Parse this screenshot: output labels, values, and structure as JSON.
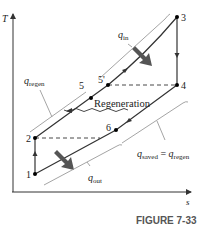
{
  "diagram": {
    "type": "T-s diagram (Brayton cycle with regeneration)",
    "axes": {
      "y_label": "T",
      "x_label": "s"
    },
    "points": [
      {
        "id": "1",
        "label": "1"
      },
      {
        "id": "2",
        "label": "2"
      },
      {
        "id": "3",
        "label": "3"
      },
      {
        "id": "4",
        "label": "4"
      },
      {
        "id": "5",
        "label": "5"
      },
      {
        "id": "5p",
        "label": "5'"
      },
      {
        "id": "6",
        "label": "6"
      }
    ],
    "labels": {
      "q_in": "q",
      "q_in_sub": "in",
      "q_out": "q",
      "q_out_sub": "out",
      "q_regen": "q",
      "q_regen_sub": "regen",
      "regeneration": "Regeneration",
      "q_saved_eq": "q",
      "q_saved_sub": "saved",
      "equals": " = ",
      "q_regen2": "q",
      "q_regen2_sub": "regen"
    },
    "caption": "FIGURE 7-33"
  },
  "colors": {
    "line": "#333333",
    "bracket": "#9a9a9a",
    "heat_arrow": "#555555",
    "caption": "#555555"
  }
}
